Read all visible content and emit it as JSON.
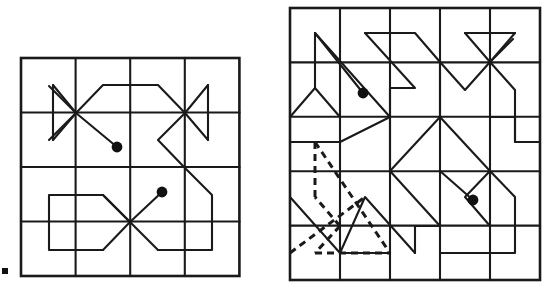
{
  "figure": {
    "title": "",
    "caption": "",
    "background_color": "#ffffff",
    "ink_color": "#1a1a1a",
    "panels": [
      {
        "id": "left-panel",
        "name": "left-lattice-diagram",
        "grid": {
          "columns": 4,
          "rows": 4,
          "x0": 21,
          "y0": 58,
          "cell_width": 54.6,
          "cell_height": 54.5,
          "line_color": "#1a1a1a",
          "border_width": 2.6,
          "inner_width": 2.1
        },
        "vertices": [
          {
            "name": "upper-left-vertex",
            "col": 1,
            "row": 1,
            "degree": 6
          },
          {
            "name": "upper-right-vertex",
            "col": 3,
            "row": 1,
            "degree": 5
          },
          {
            "name": "lower-center-vertex",
            "col": 2,
            "row": 3,
            "degree": 6
          }
        ],
        "endpoint_dots": [
          {
            "name": "endpoint-dot-upper",
            "x": 117,
            "y": 147,
            "r": 5.4
          },
          {
            "name": "endpoint-dot-lower",
            "x": 162,
            "y": 192,
            "r": 5.4
          }
        ],
        "polylines": [
          {
            "name": "upper-left-wedge",
            "style": "solid",
            "points": "53,85 53,85 76,113 53,140"
          },
          {
            "name": "upper-left-wedge-spine",
            "style": "solid",
            "points": "53,85 53,140"
          },
          {
            "name": "upper-ridge-path",
            "style": "solid",
            "points": "76,113 103,85 158,85 185,113"
          },
          {
            "name": "upper-right-wedge",
            "style": "solid",
            "points": "208,85 185,113 208,140"
          },
          {
            "name": "upper-right-wedge-spine",
            "style": "solid",
            "points": "208,85 208,140"
          },
          {
            "name": "right-descent-path",
            "style": "solid",
            "points": "185,113 158,140 185,168 212,195 212,250 158,250"
          },
          {
            "name": "upper-diagonal-to-dot",
            "style": "solid",
            "points": "76,113 117,147"
          },
          {
            "name": "lower-left-loop",
            "style": "solid",
            "points": "103,195 49,195 49,250 103,250"
          },
          {
            "name": "lower-upper-ramp",
            "style": "solid",
            "points": "103,195 130,222"
          },
          {
            "name": "lower-lower-ramp",
            "style": "solid",
            "points": "103,250 130,222"
          },
          {
            "name": "lower-right-ramp",
            "style": "solid",
            "points": "130,222 158,250"
          },
          {
            "name": "lower-diagonal-to-dot",
            "style": "solid",
            "points": "130,222 162,192"
          },
          {
            "name": "lower-left-cross-arm",
            "style": "solid",
            "points": "130,222 103,195"
          }
        ]
      },
      {
        "id": "right-panel",
        "name": "right-lattice-diagram",
        "grid": {
          "columns": 5,
          "rows": 5,
          "x0": 290,
          "y0": 8,
          "cell_width": 50.0,
          "cell_height": 54.4,
          "line_color": "#1a1a1a",
          "border_width": 2.6,
          "inner_width": 2.1
        },
        "vertices": [
          {
            "name": "top-right-vertex",
            "col": 4,
            "row": 1,
            "degree": 6
          },
          {
            "name": "bottom-left-vertex",
            "col": 1,
            "row": 4,
            "degree": 8
          }
        ],
        "endpoint_dots": [
          {
            "name": "endpoint-dot-upper-left",
            "x": 363,
            "y": 93,
            "r": 5.4
          },
          {
            "name": "endpoint-dot-lower-right",
            "x": 473,
            "y": 200,
            "r": 5.4
          }
        ],
        "polylines": [
          {
            "name": "zigzag-column-one",
            "style": "solid",
            "points": "315,33 315,88 340,62 315,88 290,142 340,142 290,197"
          },
          {
            "name": "zigzag-column-one-upper",
            "style": "solid",
            "points": "315,33 390,117"
          },
          {
            "name": "upper-dot-lead",
            "style": "solid",
            "points": "315,33 363,93"
          },
          {
            "name": "zigzag-column-two",
            "style": "solid",
            "points": "340,33 415,33 440,62 415,88 440,117 415,142 440,171 415,197 440,226 415,253 340,253"
          },
          {
            "name": "zigzag-column-two-b",
            "style": "solid",
            "points": "340,33 390,88 340,142 390,197 340,253"
          },
          {
            "name": "star-right-wedge",
            "style": "solid",
            "points": "465,35 515,35 490,62"
          },
          {
            "name": "star-right-wedge-edge",
            "style": "solid",
            "points": "465,35 490,62 515,35"
          },
          {
            "name": "star-left-vee",
            "style": "solid",
            "points": "440,62 465,90 490,62"
          },
          {
            "name": "star-drop-right",
            "style": "solid",
            "points": "490,62 515,90 515,142 540,142"
          },
          {
            "name": "mid-right-hook",
            "style": "solid",
            "points": "490,117 515,117 515,142 490,171 515,197 515,253 440,253"
          },
          {
            "name": "mid-right-diag",
            "style": "solid",
            "points": "440,117 490,171 440,226"
          },
          {
            "name": "lower-dot-lead",
            "style": "solid",
            "points": "440,171 473,200"
          },
          {
            "name": "bottom-star-arms",
            "style": "solid",
            "points": "290,197 340,253"
          }
        ],
        "dashed_polylines": [
          {
            "name": "dashed-vertical-left",
            "points": "315,142 315,197"
          },
          {
            "name": "dashed-diagonal-main",
            "points": "315,142 390,253"
          },
          {
            "name": "dashed-bottom-edge",
            "points": "315,253 390,253"
          },
          {
            "name": "dashed-arrow-upper",
            "points": "340,226 315,197"
          },
          {
            "name": "dashed-arrow-lower",
            "points": "340,226 315,253"
          },
          {
            "name": "dashed-cross-arm",
            "points": "290,253 365,197"
          }
        ]
      }
    ],
    "margin_tick": {
      "name": "left-margin-tick",
      "x": 2,
      "y": 268,
      "width": 6,
      "height": 6
    }
  }
}
